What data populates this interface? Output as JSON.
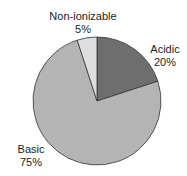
{
  "chart_data": {
    "type": "pie",
    "title": "",
    "slices": [
      {
        "label": "Acidic",
        "value": 20,
        "pct_label": "20%",
        "color": "#6e6e6e"
      },
      {
        "label": "Basic",
        "value": 75,
        "pct_label": "75%",
        "color": "#b4b4b4"
      },
      {
        "label": "Non-ionizable",
        "value": 5,
        "pct_label": "5%",
        "color": "#dedede"
      }
    ],
    "start_angle": "12 o'clock",
    "direction": "clockwise",
    "legend": "none (direct labels)"
  }
}
